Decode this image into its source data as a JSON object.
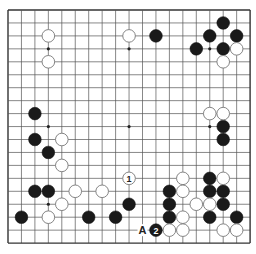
{
  "board": {
    "size": 19,
    "origin_x": 8,
    "origin_y": 10,
    "step_x": 13.45,
    "step_y": 12.95,
    "line_color": "#555555",
    "border_color": "#333333",
    "stone_radius": 6.3,
    "star_points": [
      [
        3,
        3
      ],
      [
        9,
        3
      ],
      [
        15,
        3
      ],
      [
        3,
        9
      ],
      [
        9,
        9
      ],
      [
        15,
        9
      ],
      [
        3,
        15
      ],
      [
        9,
        15
      ],
      [
        15,
        15
      ]
    ]
  },
  "stones": {
    "black": [
      [
        16,
        1
      ],
      [
        11,
        2
      ],
      [
        15,
        2
      ],
      [
        17,
        2
      ],
      [
        14,
        3
      ],
      [
        16,
        3
      ],
      [
        2,
        8
      ],
      [
        16,
        9
      ],
      [
        2,
        10
      ],
      [
        16,
        10
      ],
      [
        3,
        11
      ],
      [
        15,
        13
      ],
      [
        2,
        14
      ],
      [
        3,
        14
      ],
      [
        12,
        14
      ],
      [
        15,
        14
      ],
      [
        16,
        14
      ],
      [
        9,
        15
      ],
      [
        12,
        15
      ],
      [
        16,
        15
      ],
      [
        1,
        16
      ],
      [
        6,
        16
      ],
      [
        8,
        16
      ],
      [
        12,
        16
      ],
      [
        15,
        16
      ],
      [
        17,
        16
      ]
    ],
    "white": [
      [
        3,
        2
      ],
      [
        9,
        2
      ],
      [
        17,
        3
      ],
      [
        3,
        4
      ],
      [
        16,
        4
      ],
      [
        15,
        8
      ],
      [
        16,
        8
      ],
      [
        4,
        10
      ],
      [
        4,
        12
      ],
      [
        13,
        13
      ],
      [
        16,
        13
      ],
      [
        5,
        14
      ],
      [
        7,
        14
      ],
      [
        13,
        14
      ],
      [
        4,
        15
      ],
      [
        14,
        15
      ],
      [
        15,
        15
      ],
      [
        3,
        16
      ],
      [
        13,
        16
      ],
      [
        12,
        17
      ],
      [
        13,
        17
      ],
      [
        16,
        17
      ],
      [
        17,
        17
      ]
    ]
  },
  "numbered_moves": [
    {
      "label": "1",
      "color": "white",
      "x": 9,
      "y": 13
    },
    {
      "label": "2",
      "color": "black",
      "x": 11,
      "y": 17
    }
  ],
  "markers": [
    {
      "label": "A",
      "x": 10,
      "y": 17
    }
  ]
}
